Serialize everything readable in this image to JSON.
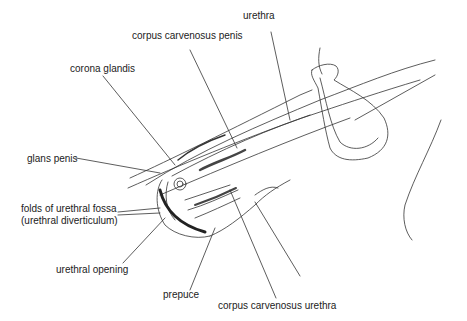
{
  "diagram": {
    "type": "anatomical-line-drawing",
    "labels": [
      {
        "id": "urethra",
        "text": "urethra",
        "x": 243,
        "y": 16
      },
      {
        "id": "corpus-carvenosus-penis",
        "text": "corpus carvenosus penis",
        "x": 132,
        "y": 36
      },
      {
        "id": "corona-glandis",
        "text": "corona glandis",
        "x": 70,
        "y": 63
      },
      {
        "id": "glans-penis",
        "text": "glans penis",
        "x": 27,
        "y": 153
      },
      {
        "id": "folds-of-urethral-fossa",
        "text": "folds of urethral fossa",
        "x": 21,
        "y": 204
      },
      {
        "id": "urethral-diverticulum",
        "text": "(urethral diverticulum)",
        "x": 21,
        "y": 216
      },
      {
        "id": "urethral-opening",
        "text": "urethral opening",
        "x": 56,
        "y": 265
      },
      {
        "id": "prepuce",
        "text": "prepuce",
        "x": 163,
        "y": 290
      },
      {
        "id": "corpus-carvenosus-urethra",
        "text": "corpus carvenosus urethra",
        "x": 218,
        "y": 301
      }
    ],
    "line_color": "#333333",
    "background": "#ffffff"
  }
}
